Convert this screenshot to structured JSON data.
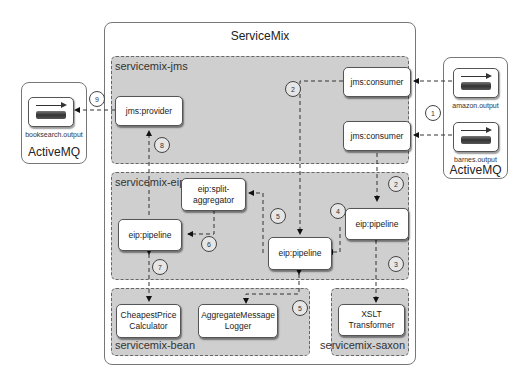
{
  "servicemix": {
    "title": "ServiceMix",
    "zones": {
      "jms": "servicemix-jms",
      "eip": "servicemix-eip",
      "bean": "servicemix-bean",
      "saxon": "servicemix-saxon"
    }
  },
  "activemq_left": {
    "title": "ActiveMQ",
    "queues": [
      {
        "label": "booksearch.output"
      }
    ]
  },
  "activemq_right": {
    "title": "ActiveMQ",
    "queues": [
      {
        "label": "amazon.output"
      },
      {
        "label": "barnes.output"
      }
    ]
  },
  "nodes": {
    "jms_provider": "jms:provider",
    "jms_consumer_1": "jms:consumer",
    "jms_consumer_2": "jms:consumer",
    "eip_split_aggregator_1": "eip:split-",
    "eip_split_aggregator_2": "aggregator",
    "eip_pipeline_left": "eip:pipeline",
    "eip_pipeline_center": "eip:pipeline",
    "eip_pipeline_right": "eip:pipeline",
    "cheapest_price_1": "CheapestPrice",
    "cheapest_price_2": "Calculator",
    "aggregate_logger_1": "AggregateMessage",
    "aggregate_logger_2": "Logger",
    "xslt": "XSLT Transformer"
  },
  "steps": {
    "s1": "1",
    "s2a": "2",
    "s2b": "2",
    "s3": "3",
    "s4": "4",
    "s5a": "5",
    "s5b": "5",
    "s6": "6",
    "s7": "7",
    "s8": "8",
    "s9": "9"
  }
}
